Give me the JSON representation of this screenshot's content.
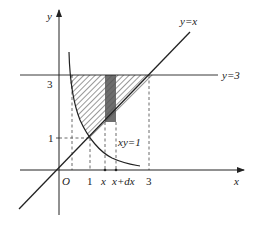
{
  "diagram": {
    "curves": [
      {
        "name": "hyperbola",
        "label": "xy=1"
      },
      {
        "name": "line-y-equals-x",
        "label": "y=x"
      },
      {
        "name": "line-y-equals-3",
        "label": "y=3"
      }
    ],
    "axes": {
      "x_label": "x",
      "y_label": "y",
      "origin_label": "O"
    },
    "x_ticks": [
      "1",
      "x",
      "x+dx",
      "3"
    ],
    "y_ticks": [
      "3",
      "1"
    ],
    "strip": {
      "from": "x",
      "to": "x+dx"
    },
    "colors": {
      "ink": "#222222",
      "hatch": "#333333",
      "strip": "#555555",
      "background": "#ffffff"
    }
  },
  "labels": {
    "y_axis": "y",
    "x_axis": "x",
    "origin": "O",
    "y_tick_3": "3",
    "y_tick_1": "1",
    "x_tick_1": "1",
    "x_tick_x": "x",
    "x_tick_xdx": "x+dx",
    "x_tick_3": "3",
    "line_yx": "y=x",
    "line_y3": "y=3",
    "curve_xy1": "xy=1"
  }
}
